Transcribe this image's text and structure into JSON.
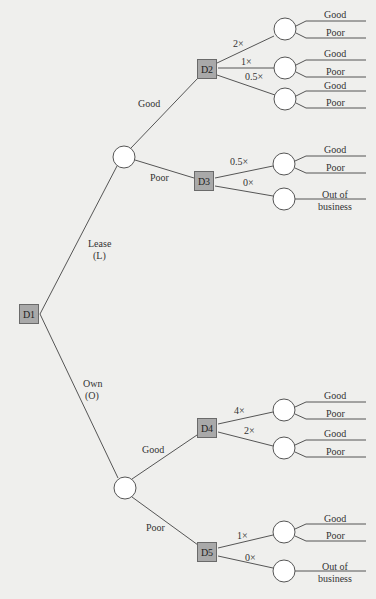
{
  "diagram": {
    "type": "decision-tree",
    "colors": {
      "background": "#efefed",
      "decision_fill": "#a9a9a9",
      "line": "#555555",
      "chance_fill": "#ffffff"
    },
    "root": {
      "label": "D1",
      "branches": [
        {
          "label": "Lease\n(L)",
          "label_line1": "Lease",
          "label_line2": "(L)",
          "chance": {
            "outcomes": [
              {
                "label": "Good",
                "decision": {
                  "label": "D2",
                  "options": [
                    {
                      "label": "2×",
                      "outcomes": [
                        "Good",
                        "Poor"
                      ]
                    },
                    {
                      "label": "1×",
                      "outcomes": [
                        "Good",
                        "Poor"
                      ]
                    },
                    {
                      "label": "0.5×",
                      "outcomes": [
                        "Good",
                        "Poor"
                      ]
                    }
                  ]
                }
              },
              {
                "label": "Poor",
                "decision": {
                  "label": "D3",
                  "options": [
                    {
                      "label": "0.5×",
                      "outcomes": [
                        "Good",
                        "Poor"
                      ]
                    },
                    {
                      "label": "0×",
                      "outcomes": [
                        "Out of business"
                      ]
                    }
                  ]
                }
              }
            ]
          }
        },
        {
          "label": "Own\n(O)",
          "label_line1": "Own",
          "label_line2": "(O)",
          "chance": {
            "outcomes": [
              {
                "label": "Good",
                "decision": {
                  "label": "D4",
                  "options": [
                    {
                      "label": "4×",
                      "outcomes": [
                        "Good",
                        "Poor"
                      ]
                    },
                    {
                      "label": "2×",
                      "outcomes": [
                        "Good",
                        "Poor"
                      ]
                    }
                  ]
                }
              },
              {
                "label": "Poor",
                "decision": {
                  "label": "D5",
                  "options": [
                    {
                      "label": "1×",
                      "outcomes": [
                        "Good",
                        "Poor"
                      ]
                    },
                    {
                      "label": "0×",
                      "outcomes": [
                        "Out of business"
                      ]
                    }
                  ]
                }
              }
            ]
          }
        }
      ]
    },
    "text": {
      "good": "Good",
      "poor": "Poor",
      "out_of": "Out of",
      "business": "business"
    }
  }
}
